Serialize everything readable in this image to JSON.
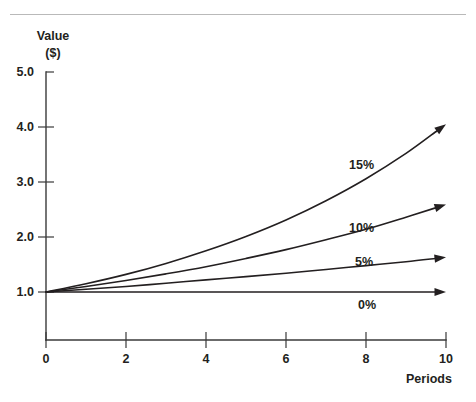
{
  "figure": {
    "background": "#ffffff",
    "ink_color": "#231f20",
    "rule_color": "#b9b9b9"
  },
  "chart_data": {
    "type": "line",
    "title": "",
    "xlabel": "Periods",
    "ylabel": "Value ($)",
    "ylabel_line1": "Value",
    "ylabel_line2": "($)",
    "xlim": [
      0,
      10
    ],
    "ylim": [
      0,
      5
    ],
    "grid": false,
    "legend_position": "inline-annotations",
    "x_ticks": [
      0,
      2,
      4,
      6,
      8,
      10
    ],
    "x_tick_labels": [
      "0",
      "2",
      "4",
      "6",
      "8",
      "10"
    ],
    "y_ticks": [
      1.0,
      2.0,
      3.0,
      4.0,
      5.0
    ],
    "y_tick_labels": [
      "1.0",
      "2.0",
      "3.0",
      "4.0",
      "5.0"
    ],
    "x": [
      0,
      1,
      2,
      3,
      4,
      5,
      6,
      7,
      8,
      9,
      10
    ],
    "series": [
      {
        "name": "15%",
        "rate": 0.15,
        "annotation": "15%",
        "values": [
          1.0,
          1.15,
          1.32,
          1.52,
          1.75,
          2.01,
          2.31,
          2.66,
          3.06,
          3.52,
          4.05
        ]
      },
      {
        "name": "10%",
        "rate": 0.1,
        "annotation": "10%",
        "values": [
          1.0,
          1.1,
          1.21,
          1.33,
          1.46,
          1.61,
          1.77,
          1.95,
          2.14,
          2.36,
          2.59
        ]
      },
      {
        "name": "5%",
        "rate": 0.05,
        "annotation": "5%",
        "values": [
          1.0,
          1.05,
          1.1,
          1.16,
          1.22,
          1.28,
          1.34,
          1.41,
          1.48,
          1.55,
          1.63
        ]
      },
      {
        "name": "0%",
        "rate": 0.0,
        "annotation": "0%",
        "values": [
          1.0,
          1.0,
          1.0,
          1.0,
          1.0,
          1.0,
          1.0,
          1.0,
          1.0,
          1.0,
          1.0
        ]
      }
    ]
  }
}
